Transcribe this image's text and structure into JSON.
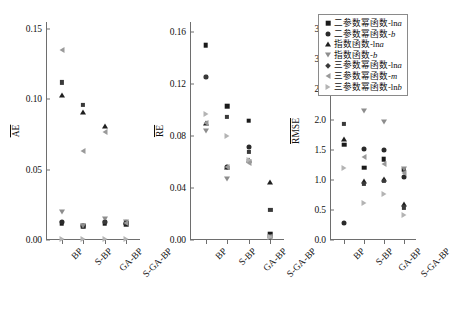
{
  "figure": {
    "width": 420,
    "height": 319,
    "background": "#ffffff",
    "axis_color": "#6e6e6e"
  },
  "legend": {
    "position": "top-right",
    "border_color": "#8a8a8a",
    "entries": [
      {
        "marker": "square",
        "color": "#1a1a1a",
        "prefix": "二参数幂函数-ln",
        "italic": "a",
        "suffix": ""
      },
      {
        "marker": "circle",
        "color": "#2a2a2a",
        "prefix": "二参数幂函数-",
        "italic": "b",
        "suffix": ""
      },
      {
        "marker": "triangle-up",
        "color": "#1f1f1f",
        "prefix": "指数函数-ln",
        "italic": "a",
        "suffix": ""
      },
      {
        "marker": "triangle-down",
        "color": "#8d8d8d",
        "prefix": "指数函数-",
        "italic": "b",
        "suffix": ""
      },
      {
        "marker": "diamond",
        "color": "#3a3a3a",
        "prefix": "三参数幂函数-ln",
        "italic": "a",
        "suffix": ""
      },
      {
        "marker": "triangle-left",
        "color": "#9a9a9a",
        "prefix": "三参数幂函数-",
        "italic": "m",
        "suffix": ""
      },
      {
        "marker": "triangle-right",
        "color": "#b4b4b4",
        "prefix": "三参数幂函数-ln",
        "italic": "b",
        "suffix": ""
      }
    ]
  },
  "chart_data": {
    "type": "scatter",
    "title": "",
    "xlabel": "",
    "grid": false,
    "categories": [
      "BP",
      "S-BP",
      "GA-BP",
      "S-GA-BP"
    ],
    "series_names": [
      "二参数幂函数-lna",
      "二参数幂函数-b",
      "指数函数-lna",
      "指数函数-b",
      "三参数幂函数-lna",
      "三参数幂函数-m",
      "三参数幂函数-lnb"
    ],
    "panels": [
      {
        "id": "AE",
        "ylabel": "AE",
        "ylabel_overline": true,
        "ylim": [
          0.0,
          0.155
        ],
        "yticks": [
          0.0,
          0.05,
          0.1,
          0.15
        ],
        "ytick_labels": [
          "0.00",
          "0.05",
          "0.10",
          "0.15"
        ],
        "series": [
          {
            "name": "二参数幂函数-lna",
            "marker": "square",
            "values": [
              0.012,
              0.01,
              0.012,
              0.011
            ]
          },
          {
            "name": "二参数幂函数-b",
            "marker": "circle",
            "values": [
              0.013,
              0.01,
              0.013,
              0.012
            ]
          },
          {
            "name": "指数函数-lna",
            "marker": "triangle-up",
            "values": [
              0.103,
              0.091,
              0.081,
              0.013
            ]
          },
          {
            "name": "指数函数-b",
            "marker": "triangle-down",
            "values": [
              0.02,
              0.01,
              0.015,
              0.013
            ]
          },
          {
            "name": "三参数幂函数-lna",
            "marker": "diamond",
            "values": [
              0.112,
              0.096,
              0.013,
              0.012
            ]
          },
          {
            "name": "三参数幂函数-m",
            "marker": "triangle-left",
            "values": [
              0.135,
              0.063,
              0.077,
              0.012
            ]
          },
          {
            "name": "三参数幂函数-lnb",
            "marker": "triangle-right",
            "values": [
              0.001,
              0.001,
              0.001,
              0.001
            ]
          }
        ]
      },
      {
        "id": "RE",
        "ylabel": "RE",
        "ylabel_overline": true,
        "ylim": [
          0.0,
          0.168
        ],
        "yticks": [
          0.0,
          0.04,
          0.08,
          0.12,
          0.16
        ],
        "ytick_labels": [
          "0.00",
          "0.04",
          "0.08",
          "0.12",
          "0.16"
        ],
        "series": [
          {
            "name": "二参数幂函数-lna",
            "marker": "square",
            "values": [
              0.15,
              0.103,
              0.092,
              0.005
            ]
          },
          {
            "name": "二参数幂函数-b",
            "marker": "circle",
            "values": [
              0.126,
              0.056,
              0.072,
              0.002
            ]
          },
          {
            "name": "指数函数-lna",
            "marker": "triangle-up",
            "values": [
              0.09,
              0.056,
              0.062,
              0.045
            ]
          },
          {
            "name": "指数函数-b",
            "marker": "triangle-down",
            "values": [
              0.084,
              0.047,
              0.06,
              0.002
            ]
          },
          {
            "name": "三参数幂函数-lna",
            "marker": "diamond",
            "values": [
              0.126,
              0.095,
              0.068,
              0.023
            ]
          },
          {
            "name": "三参数幂函数-m",
            "marker": "triangle-left",
            "values": [
              0.09,
              0.056,
              0.059,
              0.002
            ]
          },
          {
            "name": "三参数幂函数-lnb",
            "marker": "triangle-right",
            "values": [
              0.097,
              0.08,
              0.062,
              0.002
            ]
          }
        ]
      },
      {
        "id": "RMSE",
        "ylabel": "RMSE",
        "ylabel_overline": true,
        "ylim": [
          0.0,
          3.62
        ],
        "yticks": [
          0.0,
          0.5,
          1.0,
          1.5,
          2.0,
          2.5,
          3.0,
          3.5
        ],
        "ytick_labels": [
          "0.0",
          "0.5",
          "1.0",
          "1.5",
          "2.0",
          "2.5",
          "3.0",
          "3.5"
        ],
        "series": [
          {
            "name": "二参数幂函数-lna",
            "marker": "square",
            "values": [
              1.58,
              1.2,
              1.34,
              1.17
            ]
          },
          {
            "name": "二参数幂函数-b",
            "marker": "circle",
            "values": [
              0.28,
              1.51,
              1.5,
              1.04
            ]
          },
          {
            "name": "指数函数-lna",
            "marker": "triangle-up",
            "values": [
              1.67,
              0.98,
              1.02,
              0.59
            ]
          },
          {
            "name": "指数函数-b",
            "marker": "triangle-down",
            "values": [
              3.02,
              2.14,
              1.96,
              1.18
            ]
          },
          {
            "name": "三参数幂函数-lna",
            "marker": "diamond",
            "values": [
              1.93,
              0.93,
              0.98,
              0.54
            ]
          },
          {
            "name": "三参数幂函数-m",
            "marker": "triangle-left",
            "values": [
              3.26,
              1.37,
              1.27,
              1.12
            ]
          },
          {
            "name": "三参数幂函数-lnb",
            "marker": "triangle-right",
            "values": [
              1.2,
              0.62,
              0.77,
              0.42
            ]
          }
        ]
      }
    ]
  }
}
